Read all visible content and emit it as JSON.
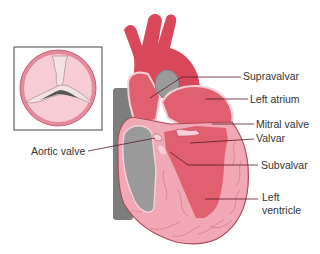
{
  "diagram": {
    "inset": {
      "description": "Aortic valve viewed from above (stenotic cusps)"
    },
    "labels": [
      {
        "id": "supravalvar",
        "text": "Supravalvar"
      },
      {
        "id": "left-atrium",
        "text": "Left atrium"
      },
      {
        "id": "mitral-valve",
        "text": "Mitral valve"
      },
      {
        "id": "valvar",
        "text": "Valvar"
      },
      {
        "id": "aortic-valve",
        "text": "Aortic valve"
      },
      {
        "id": "subvalvar",
        "text": "Subvalvar"
      },
      {
        "id": "left-ventricle-1",
        "text": "Left"
      },
      {
        "id": "left-ventricle-2",
        "text": "ventricle"
      }
    ],
    "colors": {
      "aorta_red": "#d8475a",
      "chamber_red": "#e06070",
      "myocardium_pink": "#f0a8b4",
      "pale_pink": "#f6d0d6",
      "grey": "#9a9a9a",
      "dark_grey": "#7d7d7d",
      "outline": "#b0485a",
      "leader_line": "#5a1a24",
      "text": "#333333"
    }
  }
}
